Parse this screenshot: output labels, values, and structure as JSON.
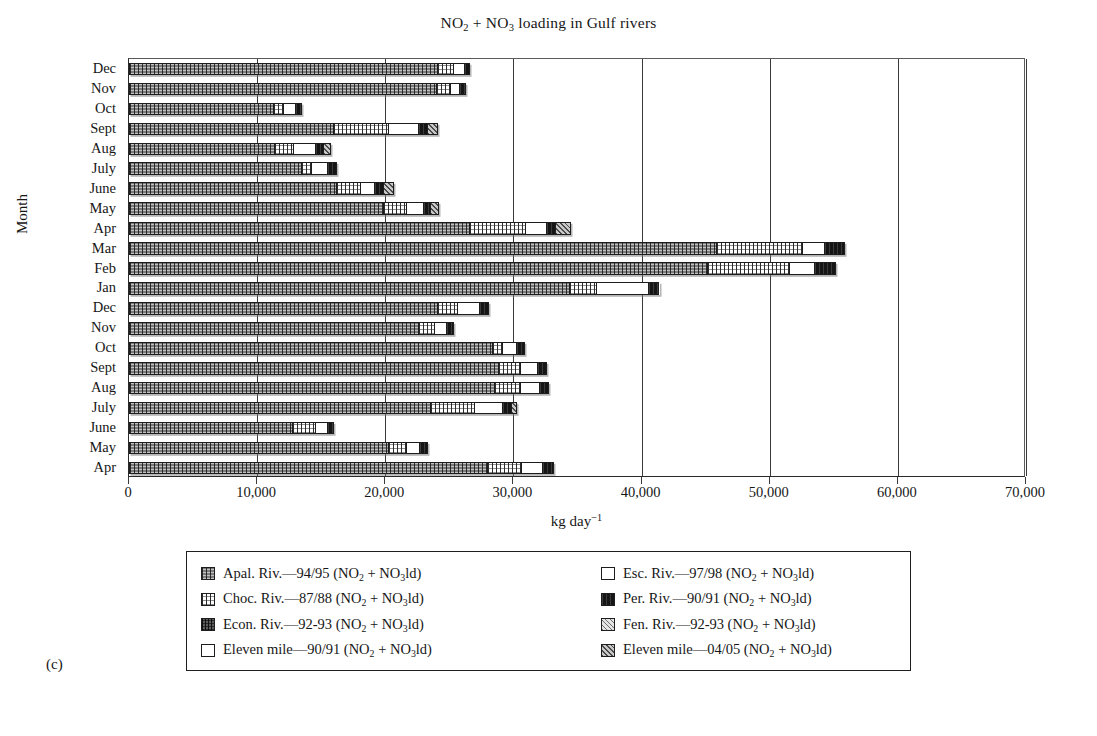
{
  "panel_label": "(c)",
  "chart_data": {
    "type": "bar",
    "orientation": "horizontal-stacked",
    "title": "NO2 + NO3 loading in Gulf rivers",
    "title_parts": [
      "NO",
      "2",
      " + NO",
      "3",
      " loading in Gulf rivers"
    ],
    "xlabel": "kg day-1",
    "xlabel_parts": [
      "kg day",
      "−1"
    ],
    "ylabel": "Month",
    "xlim": [
      0,
      70000
    ],
    "xticks": [
      0,
      10000,
      20000,
      30000,
      40000,
      50000,
      60000,
      70000
    ],
    "xtick_labels": [
      "0",
      "10,000",
      "20,000",
      "30,000",
      "40,000",
      "50,000",
      "60,000",
      "70,000"
    ],
    "grid": "vertical",
    "legend_position": "below-plot",
    "categories": [
      "Dec",
      "Nov",
      "Oct",
      "Sept",
      "Aug",
      "July",
      "June",
      "May",
      "Apr",
      "Mar",
      "Feb",
      "Jan",
      "Dec",
      "Nov",
      "Oct",
      "Sept",
      "Aug",
      "July",
      "June",
      "May",
      "Apr"
    ],
    "series": [
      {
        "name": "Apal. Riv.—94/95 (NO2 + NO3ld)",
        "key": "apal",
        "values": [
          24100,
          24000,
          11300,
          16000,
          11400,
          13500,
          16200,
          19900,
          26600,
          45900,
          45200,
          34400,
          24100,
          22600,
          28400,
          28900,
          28600,
          23600,
          12800,
          20300,
          28000
        ]
      },
      {
        "name": "Choc. Riv.—87/88 (NO2 + NO3ld)",
        "key": "choc",
        "values": [
          1300,
          1100,
          800,
          4300,
          1500,
          800,
          1900,
          1800,
          4400,
          6700,
          6400,
          2100,
          1600,
          1300,
          800,
          1700,
          2000,
          3400,
          1800,
          1400,
          2700
        ]
      },
      {
        "name": "Econ. Riv.—92-93 (NO2 + NO3ld)",
        "key": "econ",
        "values": [
          0,
          0,
          0,
          0,
          0,
          0,
          0,
          0,
          0,
          0,
          0,
          0,
          0,
          0,
          0,
          0,
          0,
          0,
          0,
          0,
          0
        ]
      },
      {
        "name": "Eleven mile—90/91 (NO2 + NO3ld)",
        "key": "elevenA",
        "values": [
          800,
          700,
          900,
          2300,
          1700,
          1200,
          1100,
          1300,
          1600,
          1700,
          1900,
          4100,
          1700,
          900,
          1100,
          1300,
          1500,
          2200,
          900,
          1000,
          1600
        ]
      },
      {
        "name": "Esc. Riv.—97/98 (NO2 + NO3ld)",
        "key": "esc",
        "values": [
          0,
          0,
          0,
          0,
          0,
          0,
          0,
          0,
          0,
          0,
          0,
          0,
          0,
          0,
          0,
          0,
          0,
          0,
          0,
          0,
          0
        ]
      },
      {
        "name": "Per. Riv.—90/91 (NO2 + NO3ld)",
        "key": "per",
        "values": [
          400,
          500,
          500,
          700,
          600,
          700,
          700,
          600,
          700,
          1600,
          1700,
          800,
          700,
          600,
          600,
          700,
          700,
          700,
          500,
          600,
          900
        ]
      },
      {
        "name": "Fen. Riv.—92-93 (NO2 + NO3ld)",
        "key": "fen",
        "values": [
          0,
          0,
          0,
          0,
          0,
          0,
          0,
          0,
          0,
          0,
          0,
          0,
          0,
          0,
          0,
          0,
          0,
          0,
          0,
          0,
          0
        ]
      },
      {
        "name": "Eleven mile—04/05 (NO2 + NO3ld)",
        "key": "elevenB",
        "values": [
          0,
          0,
          0,
          800,
          600,
          0,
          800,
          600,
          1200,
          0,
          0,
          0,
          0,
          0,
          0,
          0,
          0,
          400,
          0,
          0,
          0
        ]
      }
    ],
    "totals": [
      26600,
      26300,
      13500,
      24100,
      15800,
      16200,
      20700,
      24200,
      34500,
      55900,
      55200,
      41400,
      28100,
      25400,
      30900,
      32600,
      32800,
      30300,
      16000,
      23300,
      33200
    ]
  },
  "legend": {
    "left_column": [
      {
        "label": "Apal. Riv.—94/95 (NO",
        "sub1": "2",
        "mid": " + NO",
        "sub2": "3",
        "tail": "ld)",
        "key": "apal"
      },
      {
        "label": "Choc. Riv.—87/88 (NO",
        "sub1": "2",
        "mid": " + NO",
        "sub2": "3",
        "tail": "ld)",
        "key": "choc"
      },
      {
        "label": "Econ. Riv.—92-93 (NO",
        "sub1": "2",
        "mid": " + NO",
        "sub2": "3",
        "tail": "ld)",
        "key": "econ"
      },
      {
        "label": "Eleven mile—90/91 (NO",
        "sub1": "2",
        "mid": " + NO",
        "sub2": "3",
        "tail": "ld)",
        "key": "elevenA"
      }
    ],
    "right_column": [
      {
        "label": "Esc. Riv.—97/98 (NO",
        "sub1": "2",
        "mid": " + NO",
        "sub2": "3",
        "tail": "ld)",
        "key": "esc"
      },
      {
        "label": "Per. Riv.—90/91 (NO",
        "sub1": "2",
        "mid": " + NO",
        "sub2": "3",
        "tail": "ld)",
        "key": "per"
      },
      {
        "label": "Fen. Riv.—92-93 (NO",
        "sub1": "2",
        "mid": " + NO",
        "sub2": "3",
        "tail": "ld)",
        "key": "fen"
      },
      {
        "label": "Eleven mile—04/05 (NO",
        "sub1": "2",
        "mid": " + NO",
        "sub2": "3",
        "tail": "ld)",
        "key": "elevenB"
      }
    ]
  },
  "colors": {
    "apal": "#7b7b7b",
    "choc": "#fdfdfd",
    "econ": "#5d5d5d",
    "elevenA": "#ffffff",
    "esc": "#ffffff",
    "per": "#151515",
    "fen": "#e4e4e4",
    "elevenB": "#c8c8c8",
    "axis": "#2a2a2a",
    "grid": "#3a3a3a",
    "text": "#161616"
  }
}
